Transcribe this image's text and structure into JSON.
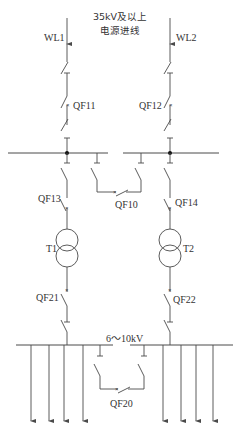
{
  "diagram": {
    "title_line1": "35kV及以上",
    "title_line2": "电源进线",
    "incoming": [
      {
        "label": "WL1"
      },
      {
        "label": "WL2"
      }
    ],
    "breakers": {
      "qf11": "QF11",
      "qf12": "QF12",
      "qf13": "QF13",
      "qf14": "QF14",
      "qf10": "QF10",
      "qf21": "QF21",
      "qf22": "QF22",
      "qf20": "QF20"
    },
    "transformers": {
      "t1": "T1",
      "t2": "T2"
    },
    "lv_bus_label": "6～10kV",
    "breaker_mark": "×",
    "colors": {
      "line": "#4a4a4a",
      "text": "#333333",
      "node": "#111111"
    }
  }
}
